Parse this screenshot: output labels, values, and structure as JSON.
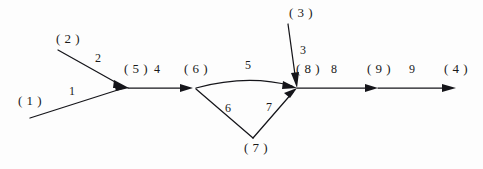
{
  "diagram": {
    "type": "directed-graph",
    "background_color": "#fdfdfd",
    "line_color": "#15151a",
    "nodes": [
      {
        "id": "n1",
        "label": "( 1 )",
        "x": 30,
        "y": 105
      },
      {
        "id": "n2",
        "label": "( 2 )",
        "x": 68,
        "y": 43
      },
      {
        "id": "n3",
        "label": "( 3 )",
        "x": 301,
        "y": 17
      },
      {
        "id": "n4",
        "label": "( 4 )",
        "x": 456,
        "y": 73
      },
      {
        "id": "n5",
        "label": "( 5 )",
        "x": 136,
        "y": 73
      },
      {
        "id": "n6",
        "label": "( 6 )",
        "x": 196,
        "y": 73
      },
      {
        "id": "n7",
        "label": "( 7 )",
        "x": 256,
        "y": 152
      },
      {
        "id": "n8",
        "label": "( 8 )",
        "x": 308,
        "y": 73
      },
      {
        "id": "n9",
        "label": "( 9 )",
        "x": 379,
        "y": 73
      }
    ],
    "edges": [
      {
        "id": "e1",
        "label": "1",
        "from": "n1",
        "to": "n5",
        "label_x": 72,
        "label_y": 95,
        "shape": "straight"
      },
      {
        "id": "e2",
        "label": "2",
        "from": "n2",
        "to": "n5",
        "label_x": 98,
        "label_y": 62,
        "shape": "straight"
      },
      {
        "id": "e3",
        "label": "3",
        "from": "n3",
        "to": "n8",
        "label_x": 303,
        "label_y": 54,
        "shape": "straight"
      },
      {
        "id": "e4",
        "label": "4",
        "from": "n5",
        "to": "n6",
        "label_x": 157,
        "label_y": 73,
        "shape": "straight"
      },
      {
        "id": "e5",
        "label": "5",
        "from": "n6",
        "to": "n8",
        "label_x": 248,
        "label_y": 69,
        "shape": "curved"
      },
      {
        "id": "e6",
        "label": "6",
        "from": "n6",
        "to": "n7",
        "label_x": 228,
        "label_y": 112,
        "shape": "straight"
      },
      {
        "id": "e7",
        "label": "7",
        "from": "n7",
        "to": "n8",
        "label_x": 269,
        "label_y": 111,
        "shape": "straight"
      },
      {
        "id": "e8",
        "label": "8",
        "from": "n8",
        "to": "n9",
        "label_x": 334,
        "label_y": 73,
        "shape": "straight"
      },
      {
        "id": "e9",
        "label": "9",
        "from": "n9",
        "to": "n4",
        "label_x": 412,
        "label_y": 73,
        "shape": "straight"
      }
    ]
  }
}
